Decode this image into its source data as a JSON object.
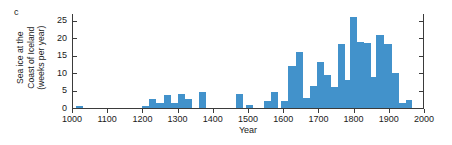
{
  "figure": {
    "panel_label": "c",
    "axis_color": "#3b3b3b",
    "bar_color": "#4292cb",
    "background": "#ffffff"
  },
  "chart_data": {
    "type": "bar",
    "title": "",
    "subtitle": "",
    "panel": "c",
    "xlabel": "Year",
    "ylabel": "Sea ice at the\nCoast of Iceland\n(weeks per year)",
    "ylabel_lines": [
      "Sea ice at the",
      "Coast of Iceland",
      "(weeks per year)"
    ],
    "xlim": [
      1000,
      2000
    ],
    "ylim": [
      0,
      27
    ],
    "grid": false,
    "legend": null,
    "xticks": [
      1000,
      1100,
      1200,
      1300,
      1400,
      1500,
      1600,
      1700,
      1800,
      1900,
      2000
    ],
    "xtick_labels": [
      "1000",
      "1100",
      "1200",
      "1300",
      "1400",
      "1500",
      "1600",
      "1700",
      "1800",
      "1900",
      "2000"
    ],
    "yticks": [
      0,
      5,
      10,
      15,
      20,
      25
    ],
    "ytick_labels": [
      "0",
      "5",
      "10",
      "15",
      "20",
      "25"
    ],
    "bin_width": 20,
    "xunit": "year",
    "yunit": "weeks per year",
    "bins": [
      {
        "x0": 1010,
        "x1": 1030,
        "value": 0.7
      },
      {
        "x0": 1200,
        "x1": 1220,
        "value": 0.5
      },
      {
        "x0": 1220,
        "x1": 1240,
        "value": 2.7
      },
      {
        "x0": 1240,
        "x1": 1260,
        "value": 1.5
      },
      {
        "x0": 1260,
        "x1": 1280,
        "value": 3.7
      },
      {
        "x0": 1280,
        "x1": 1300,
        "value": 1.5
      },
      {
        "x0": 1300,
        "x1": 1320,
        "value": 4.0
      },
      {
        "x0": 1320,
        "x1": 1340,
        "value": 2.7
      },
      {
        "x0": 1360,
        "x1": 1380,
        "value": 4.6
      },
      {
        "x0": 1465,
        "x1": 1485,
        "value": 4.0
      },
      {
        "x0": 1495,
        "x1": 1515,
        "value": 0.8
      },
      {
        "x0": 1545,
        "x1": 1565,
        "value": 1.9
      },
      {
        "x0": 1565,
        "x1": 1585,
        "value": 4.5
      },
      {
        "x0": 1595,
        "x1": 1615,
        "value": 1.9
      },
      {
        "x0": 1615,
        "x1": 1635,
        "value": 12.2
      },
      {
        "x0": 1635,
        "x1": 1655,
        "value": 16.2
      },
      {
        "x0": 1655,
        "x1": 1675,
        "value": 3.0
      },
      {
        "x0": 1675,
        "x1": 1695,
        "value": 6.3
      },
      {
        "x0": 1695,
        "x1": 1715,
        "value": 13.3
      },
      {
        "x0": 1715,
        "x1": 1735,
        "value": 9.6
      },
      {
        "x0": 1735,
        "x1": 1755,
        "value": 5.9
      },
      {
        "x0": 1755,
        "x1": 1775,
        "value": 18.4
      },
      {
        "x0": 1775,
        "x1": 1790,
        "value": 8.0
      },
      {
        "x0": 1790,
        "x1": 1810,
        "value": 26.0
      },
      {
        "x0": 1810,
        "x1": 1830,
        "value": 19.1
      },
      {
        "x0": 1830,
        "x1": 1850,
        "value": 18.6
      },
      {
        "x0": 1850,
        "x1": 1865,
        "value": 8.8
      },
      {
        "x0": 1865,
        "x1": 1885,
        "value": 20.9
      },
      {
        "x0": 1885,
        "x1": 1910,
        "value": 18.4
      },
      {
        "x0": 1910,
        "x1": 1930,
        "value": 10.0
      },
      {
        "x0": 1930,
        "x1": 1950,
        "value": 1.3
      },
      {
        "x0": 1950,
        "x1": 1965,
        "value": 2.4
      }
    ]
  }
}
